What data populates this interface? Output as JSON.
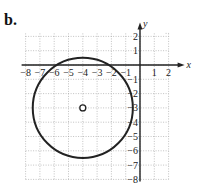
{
  "figure_label": "b.",
  "chart_data": {
    "type": "scatter",
    "title": "",
    "xlabel": "x",
    "ylabel": "y",
    "xlim": [
      -8,
      2
    ],
    "ylim": [
      -8,
      2
    ],
    "grid": true,
    "x_ticks": [
      -8,
      -7,
      -6,
      -5,
      -4,
      -3,
      -2,
      -1,
      1,
      2
    ],
    "y_ticks": [
      2,
      1,
      -1,
      -2,
      -3,
      -4,
      -5,
      -6,
      -7,
      -8
    ],
    "shapes": [
      {
        "shape": "circle",
        "center": [
          -4,
          -3
        ],
        "radius": 3.5
      }
    ],
    "points": [
      {
        "x": -4,
        "y": -3,
        "marker": "open-circle",
        "label": "center"
      }
    ]
  }
}
